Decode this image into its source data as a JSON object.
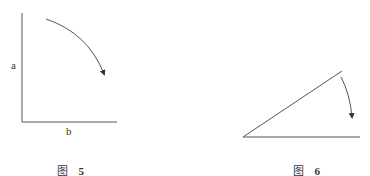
{
  "figures": [
    {
      "id": "fig5",
      "caption_prefix": "图",
      "caption_number": "5",
      "axis_labels": {
        "vertical": "a",
        "horizontal": "b"
      },
      "description": "Right-angle axes with a clockwise curved arrow"
    },
    {
      "id": "fig6",
      "caption_prefix": "图",
      "caption_number": "6",
      "description": "Acute angle with a clockwise curved arrow rotating the upper ray toward the base"
    }
  ],
  "colors": {
    "stroke": "#444444",
    "background": "#ffffff"
  }
}
